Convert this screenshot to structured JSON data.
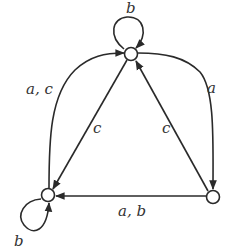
{
  "diagram": {
    "type": "finite-automaton",
    "colors": {
      "stroke": "#2a2a2a",
      "background": "#ffffff",
      "label": "#333333"
    },
    "nodes": [
      {
        "id": "top",
        "x": 131,
        "y": 54
      },
      {
        "id": "left",
        "x": 48,
        "y": 195
      },
      {
        "id": "right",
        "x": 213,
        "y": 197
      }
    ],
    "edges": [
      {
        "from": "top",
        "to": "top",
        "label": "b"
      },
      {
        "from": "left",
        "to": "left",
        "label": "b"
      },
      {
        "from": "left",
        "to": "top",
        "label": "a, c"
      },
      {
        "from": "top",
        "to": "right",
        "label": "a"
      },
      {
        "from": "top",
        "to": "left",
        "label": "c"
      },
      {
        "from": "right",
        "to": "top",
        "label": "c"
      },
      {
        "from": "right",
        "to": "left",
        "label": "a, b"
      }
    ],
    "labels": {
      "top_loop": "b",
      "left_loop": "b",
      "left_to_top": "a, c",
      "top_to_right": "a",
      "top_to_left": "c",
      "right_to_top": "c",
      "right_to_left": "a, b"
    }
  }
}
